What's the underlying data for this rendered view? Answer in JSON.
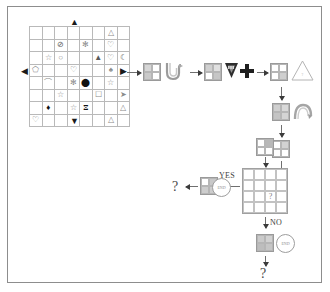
{
  "figure": {
    "type": "flowchart-puzzle",
    "border_color": "#8d8d8d",
    "background": "#ffffff"
  },
  "matrix": {
    "name": "symbol-matrix",
    "rows": 8,
    "cols": 8,
    "cells": [
      [
        "",
        "",
        "",
        "",
        "",
        "",
        "△",
        ""
      ],
      [
        "",
        "",
        "⊘",
        "",
        "✻",
        "",
        "♡",
        ""
      ],
      [
        "",
        "☆",
        "○",
        "",
        "",
        "▲",
        "♡",
        "☾"
      ],
      [
        "⬠",
        "",
        "",
        "♡",
        "",
        "",
        "♠",
        ""
      ],
      [
        "",
        "⌒",
        "",
        "✻",
        "⬤",
        "",
        "☆",
        ""
      ],
      [
        "",
        "",
        "☆",
        "",
        "",
        "☐",
        "",
        "➤"
      ],
      [
        "",
        "♦",
        "",
        "☆",
        "⧖",
        "",
        "",
        "△"
      ],
      [
        "♡",
        "",
        "",
        "",
        "",
        "",
        "△",
        ""
      ]
    ],
    "dark_cells": [
      [
        4,
        4
      ],
      [
        6,
        1
      ],
      [
        6,
        4
      ]
    ],
    "mid_cells": [
      [
        1,
        2
      ],
      [
        2,
        7
      ],
      [
        2,
        5
      ]
    ],
    "axes": {
      "top_arrow": "▲",
      "bottom_arrow": "▼",
      "left_arrow": "◀",
      "right_arrow": "▶"
    }
  },
  "flow": {
    "step1": {
      "grid_name": "grid-2x2-step1",
      "cells": [
        "#d6d6d6",
        "#ffffff",
        "#c9c9c9",
        "#ffffff"
      ],
      "shape": "wave-hook-glyph"
    },
    "step2": {
      "grid_name": "grid-2x2-step2",
      "cells": [
        "#d0d0d0",
        "#e0e0e0",
        "#ffffff",
        "#c6c6c6"
      ],
      "shape_triangle": "filled-down-triangle",
      "shape_plus": "filled-plus"
    },
    "step3": {
      "grid_name": "grid-2x2-step3",
      "cells": [
        "#ffffff",
        "#ffffff",
        "#ffffff",
        "#cfcfcf"
      ],
      "triangle_label": "?"
    },
    "step4": {
      "grid_name": "grid-2x2-step4",
      "cells": [
        "#cfcfcf",
        "#d9d9d9",
        "#c4c4c4",
        "#d4d4d4"
      ],
      "shape": "arc-swirl-glyph"
    },
    "step5": {
      "grid_name": "grid-2x2-step5",
      "cells": [
        "#ffffff",
        "#d2d2d2",
        "#ffffff",
        "#ffffff"
      ]
    },
    "step6": {
      "grid_name": "grid-2x2-step6",
      "cells": [
        "#ffffff",
        "#b8b8b8",
        "#ffffff",
        "#ffffff"
      ]
    }
  },
  "decision": {
    "grid_name": "decision-grid-4x4",
    "question_mark": "?",
    "yes_label": "YES",
    "no_label": "NO"
  },
  "yes_branch": {
    "grid_name": "grid-2x2-yes",
    "cells": [
      "#ffffff",
      "#c8c8c8",
      "#cdcdcd",
      "#cdcdcd"
    ],
    "badge_text": "END",
    "result": "?"
  },
  "no_branch": {
    "grid_name": "grid-2x2-no",
    "cells": [
      "#cacaca",
      "#d2d2d2",
      "#bdbdbd",
      "#c6c6c6"
    ],
    "badge_text": "END",
    "result": "?"
  },
  "colors": {
    "line": "#6f6f6f",
    "arrowhead": "#3b3b3b",
    "grid_line": "#bdbdbd",
    "text": "#3d3d3d"
  }
}
